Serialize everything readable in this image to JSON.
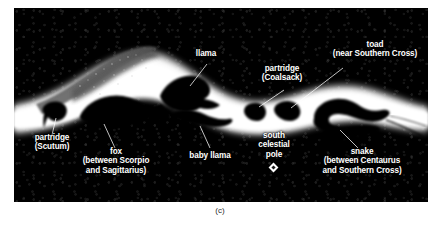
{
  "figure": {
    "caption": "(c)",
    "panel_background": "#060606",
    "label_color": "#ffffff",
    "band_color": "#ffffff",
    "dark_nebula_color": "#000000"
  },
  "labels": [
    {
      "id": "toad",
      "lines": [
        "toad",
        "(near Southern Cross)"
      ]
    },
    {
      "id": "llama",
      "lines": [
        "llama"
      ]
    },
    {
      "id": "partridge-coalsack",
      "lines": [
        "partridge",
        "(Coalsack)"
      ]
    },
    {
      "id": "partridge-scutum",
      "lines": [
        "partridge",
        "(Scutum)"
      ]
    },
    {
      "id": "fox",
      "lines": [
        "fox",
        "(between Scorpio",
        "and Sagittarius)"
      ]
    },
    {
      "id": "baby-llama",
      "lines": [
        "baby llama"
      ]
    },
    {
      "id": "south-celestial-pole",
      "lines": [
        "south",
        "celestial",
        "pole"
      ]
    },
    {
      "id": "snake",
      "lines": [
        "snake",
        "(between Centaurus",
        "and Southern Cross)"
      ]
    }
  ]
}
